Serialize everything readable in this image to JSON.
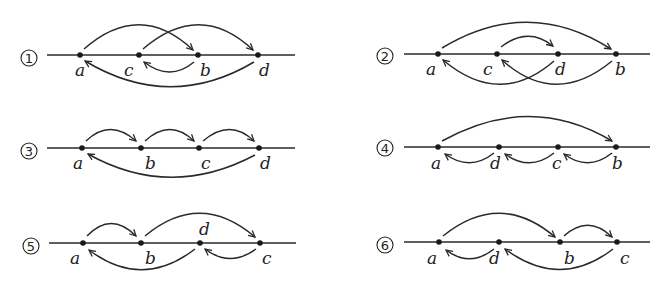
{
  "figure": {
    "diagrams": [
      {
        "id": "1",
        "symbol": "①",
        "points": [
          {
            "name": "a",
            "x": 80
          },
          {
            "name": "c",
            "x": 139
          },
          {
            "name": "b",
            "x": 198
          },
          {
            "name": "d",
            "x": 258
          }
        ],
        "arrows": [
          {
            "from": "a",
            "to": "b",
            "side": "above"
          },
          {
            "from": "c",
            "to": "d",
            "side": "above"
          },
          {
            "from": "b",
            "to": "c",
            "side": "below"
          },
          {
            "from": "d",
            "to": "a",
            "side": "below"
          }
        ]
      },
      {
        "id": "2",
        "symbol": "②",
        "points": [
          {
            "name": "a",
            "x": 438
          },
          {
            "name": "c",
            "x": 497
          },
          {
            "name": "d",
            "x": 558
          },
          {
            "name": "b",
            "x": 616
          }
        ],
        "arrows": [
          {
            "from": "a",
            "to": "b",
            "side": "above"
          },
          {
            "from": "c",
            "to": "d",
            "side": "above"
          },
          {
            "from": "d",
            "to": "a",
            "side": "below"
          },
          {
            "from": "b",
            "to": "c",
            "side": "below"
          }
        ]
      },
      {
        "id": "3",
        "symbol": "③",
        "points": [
          {
            "name": "a",
            "x": 82
          },
          {
            "name": "b",
            "x": 141
          },
          {
            "name": "c",
            "x": 199
          },
          {
            "name": "d",
            "x": 259
          }
        ],
        "arrows": [
          {
            "from": "a",
            "to": "b",
            "side": "above"
          },
          {
            "from": "b",
            "to": "c",
            "side": "above"
          },
          {
            "from": "c",
            "to": "d",
            "side": "above"
          },
          {
            "from": "d",
            "to": "a",
            "side": "below"
          }
        ]
      },
      {
        "id": "4",
        "symbol": "④",
        "points": [
          {
            "name": "a",
            "x": 438
          },
          {
            "name": "d",
            "x": 499
          },
          {
            "name": "c",
            "x": 558
          },
          {
            "name": "b",
            "x": 616
          }
        ],
        "arrows": [
          {
            "from": "a",
            "to": "b",
            "side": "above"
          },
          {
            "from": "d",
            "to": "a",
            "side": "below"
          },
          {
            "from": "c",
            "to": "d",
            "side": "below"
          },
          {
            "from": "b",
            "to": "c",
            "side": "below"
          }
        ]
      },
      {
        "id": "5",
        "symbol": "⑤",
        "points": [
          {
            "name": "a",
            "x": 83
          },
          {
            "name": "b",
            "x": 141
          },
          {
            "name": "d",
            "x": 200,
            "label_above": true
          },
          {
            "name": "c",
            "x": 260
          }
        ],
        "arrows": [
          {
            "from": "a",
            "to": "b",
            "side": "above"
          },
          {
            "from": "b",
            "to": "c",
            "side": "above"
          },
          {
            "from": "d",
            "to": "a",
            "side": "below"
          },
          {
            "from": "c",
            "to": "d",
            "side": "below"
          }
        ]
      },
      {
        "id": "6",
        "symbol": "⑥",
        "points": [
          {
            "name": "a",
            "x": 439
          },
          {
            "name": "d",
            "x": 499
          },
          {
            "name": "b",
            "x": 560
          },
          {
            "name": "c",
            "x": 617
          }
        ],
        "arrows": [
          {
            "from": "a",
            "to": "b",
            "side": "above"
          },
          {
            "from": "b",
            "to": "c",
            "side": "above"
          },
          {
            "from": "d",
            "to": "a",
            "side": "below"
          },
          {
            "from": "c",
            "to": "d",
            "side": "below"
          }
        ]
      }
    ]
  },
  "labels": {
    "d1": {
      "num": "1",
      "a": "a",
      "c": "c",
      "b": "b",
      "d": "d"
    },
    "d2": {
      "num": "2",
      "a": "a",
      "c": "c",
      "d": "d",
      "b": "b"
    },
    "d3": {
      "num": "3",
      "a": "a",
      "b": "b",
      "c": "c",
      "d": "d"
    },
    "d4": {
      "num": "4",
      "a": "a",
      "d": "d",
      "c": "c",
      "b": "b"
    },
    "d5": {
      "num": "5",
      "a": "a",
      "b": "b",
      "d": "d",
      "c": "c"
    },
    "d6": {
      "num": "6",
      "a": "a",
      "d": "d",
      "b": "b",
      "c": "c"
    }
  },
  "colors": {
    "ink": "#2a2a2a",
    "background": "#ffffff"
  }
}
